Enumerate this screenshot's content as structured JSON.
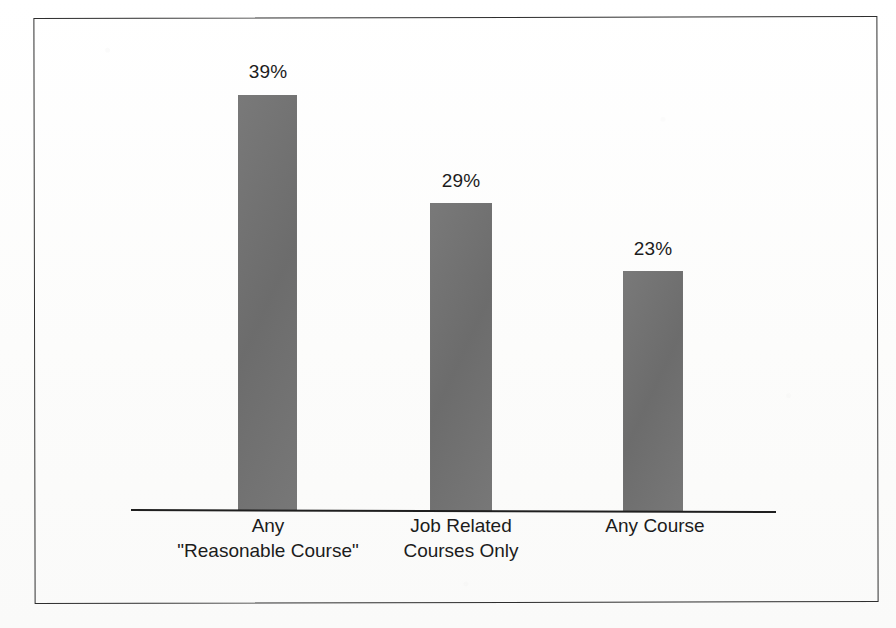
{
  "chart_data": {
    "type": "bar",
    "title": "",
    "subtitle": "",
    "xlabel": "",
    "ylabel": "",
    "categories": [
      "Any \"Reasonable Course\"",
      "Job Related Courses Only",
      "Any Course"
    ],
    "category_lines": [
      [
        "Any",
        "\"Reasonable Course\""
      ],
      [
        "Job Related",
        "Courses Only"
      ],
      [
        "Any Course",
        ""
      ]
    ],
    "values": [
      39,
      29,
      23
    ],
    "value_labels": [
      "39%",
      "29%",
      "23%"
    ],
    "ylim": [
      0,
      48
    ],
    "grid": false,
    "legend": false,
    "bar_color": "#727272",
    "axis_color": "#1f1f1f",
    "frame_color": "#2e2e2e",
    "background_color": "#ffffff"
  },
  "bars": [
    {
      "label_line1": "Any",
      "label_line2": "\"Reasonable Course\"",
      "value_label": "39%"
    },
    {
      "label_line1": "Job Related",
      "label_line2": "Courses Only",
      "value_label": "29%"
    },
    {
      "label_line1": "Any Course",
      "label_line2": "",
      "value_label": "23%"
    }
  ]
}
